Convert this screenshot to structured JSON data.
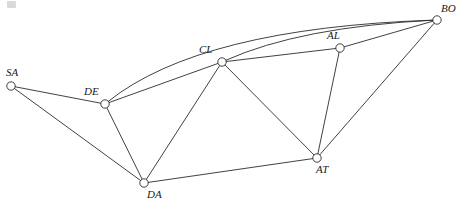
{
  "figure": {
    "width": 462,
    "height": 202,
    "background_color": "#ffffff",
    "stroke_color": "#2b2b2b",
    "node_fill_color": "#ffffff",
    "label_color": "#1a1a1a"
  },
  "chart_data": {
    "type": "diagram",
    "subtype": "node-link-graph",
    "title": "",
    "xlabel": "",
    "ylabel": "",
    "grid": false,
    "legend": null,
    "directed": false,
    "nodes": [
      {
        "id": "SA",
        "label": "SA",
        "x": 11,
        "y": 86,
        "r": 4.2,
        "label_x": 6,
        "label_y": 76
      },
      {
        "id": "DE",
        "label": "DE",
        "x": 105,
        "y": 104,
        "r": 4.2,
        "label_x": 84,
        "label_y": 95
      },
      {
        "id": "CL",
        "label": "CL",
        "x": 222,
        "y": 62,
        "r": 4.2,
        "label_x": 199,
        "label_y": 53
      },
      {
        "id": "AL",
        "label": "AL",
        "x": 340,
        "y": 48,
        "r": 4.2,
        "label_x": 327,
        "label_y": 39
      },
      {
        "id": "BO",
        "label": "BO",
        "x": 437,
        "y": 20,
        "r": 4.2,
        "label_x": 441,
        "label_y": 12
      },
      {
        "id": "DA",
        "label": "DA",
        "x": 144,
        "y": 183,
        "r": 4.2,
        "label_x": 147,
        "label_y": 198
      },
      {
        "id": "AT",
        "label": "AT",
        "x": 317,
        "y": 158,
        "r": 4.2,
        "label_x": 316,
        "label_y": 173
      }
    ],
    "edges": [
      {
        "source": "SA",
        "target": "DE",
        "shape": "straight"
      },
      {
        "source": "SA",
        "target": "DA",
        "shape": "straight"
      },
      {
        "source": "DE",
        "target": "DA",
        "shape": "straight"
      },
      {
        "source": "DE",
        "target": "CL",
        "shape": "straight"
      },
      {
        "source": "DE",
        "target": "BO",
        "shape": "curved",
        "curve_control": [
          200,
          28
        ]
      },
      {
        "source": "CL",
        "target": "DA",
        "shape": "straight"
      },
      {
        "source": "CL",
        "target": "AT",
        "shape": "straight"
      },
      {
        "source": "CL",
        "target": "AL",
        "shape": "straight"
      },
      {
        "source": "CL",
        "target": "BO",
        "shape": "curved",
        "curve_control": [
          300,
          27
        ]
      },
      {
        "source": "AL",
        "target": "BO",
        "shape": "straight"
      },
      {
        "source": "AL",
        "target": "AT",
        "shape": "straight"
      },
      {
        "source": "AT",
        "target": "BO",
        "shape": "straight"
      },
      {
        "source": "AT",
        "target": "DA",
        "shape": "straight"
      }
    ]
  }
}
